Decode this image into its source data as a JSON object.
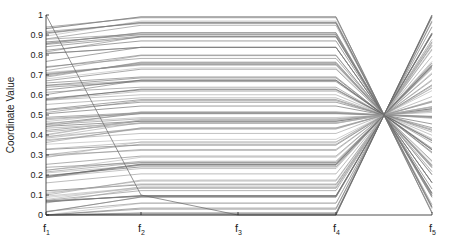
{
  "chart_data": {
    "type": "line",
    "subtype": "parallel-coordinates",
    "title": "",
    "xlabel": "",
    "ylabel": "Coordinate Value",
    "ylim": [
      0,
      1
    ],
    "yticks": [
      "0",
      "0.1",
      "0.2",
      "0.3",
      "0.4",
      "0.5",
      "0.6",
      "0.7",
      "0.8",
      "0.9",
      "1"
    ],
    "categories": [
      "f1",
      "f2",
      "f3",
      "f4",
      "f5"
    ],
    "grid": false,
    "legend": null,
    "series": [
      {
        "name": "outlier",
        "values": [
          1.0,
          0.1,
          0.0,
          0.0,
          1.0
        ]
      },
      {
        "name": "typical-high",
        "values": [
          0.95,
          0.99,
          0.99,
          0.99,
          0.01
        ]
      },
      {
        "name": "typical-mid",
        "values": [
          0.48,
          0.5,
          0.5,
          0.5,
          0.5
        ]
      },
      {
        "name": "typical-low",
        "values": [
          0.03,
          0.01,
          0.01,
          0.01,
          0.99
        ]
      }
    ]
  },
  "axes": {
    "ylabel": "Coordinate Value",
    "x_names": [
      "f",
      "f",
      "f",
      "f",
      "f"
    ],
    "x_subs": [
      "1",
      "2",
      "3",
      "4",
      "5"
    ]
  }
}
